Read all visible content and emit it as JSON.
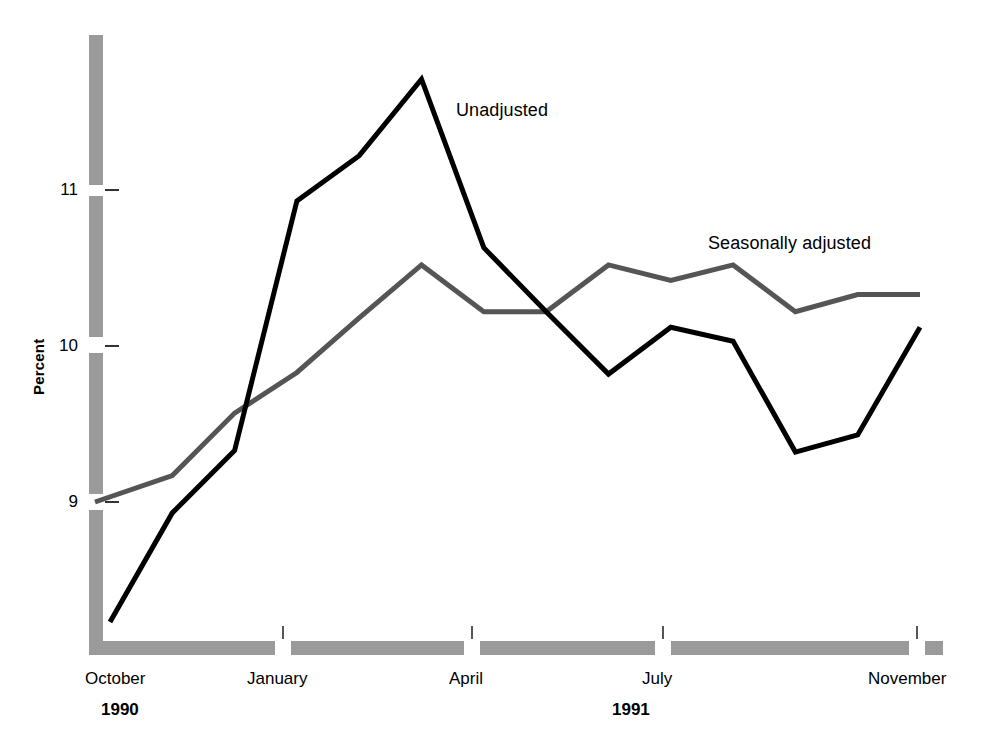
{
  "chart_data": {
    "type": "line",
    "title": "",
    "subtitle": "",
    "xlabel": "",
    "ylabel": "Percent",
    "ylim": [
      8.0,
      11.9
    ],
    "yticks": [
      9,
      10,
      11
    ],
    "ytick_labels": [
      "9",
      "10",
      "11"
    ],
    "grid": false,
    "legend_position": "inline-annotation",
    "x": [
      "October 1990",
      "November 1990",
      "December 1990",
      "January 1991",
      "February 1991",
      "March 1991",
      "April 1991",
      "May 1991",
      "June 1991",
      "July 1991",
      "August 1991",
      "September 1991",
      "October 1991",
      "November 1991"
    ],
    "xtick_labels": [
      "October",
      "January",
      "April",
      "July",
      "November"
    ],
    "xtick_x_index": [
      0,
      3,
      6,
      9,
      13
    ],
    "year_labels": [
      "1990",
      "1991"
    ],
    "series": [
      {
        "name": "Unadjusted",
        "color": "#000000",
        "values": [
          8.23,
          8.93,
          9.33,
          10.93,
          11.22,
          11.71,
          10.63,
          10.22,
          9.82,
          10.12,
          10.03,
          9.32,
          9.43,
          10.12
        ]
      },
      {
        "name": "Seasonally adjusted",
        "color": "#555555",
        "values": [
          9.0,
          9.17,
          9.57,
          9.83,
          10.18,
          10.52,
          10.22,
          10.22,
          10.52,
          10.42,
          10.52,
          10.22,
          10.33,
          10.33
        ]
      }
    ],
    "annotations": [
      {
        "text": "Unadjusted",
        "series": "Unadjusted"
      },
      {
        "text": "Seasonally adjusted",
        "series": "Seasonally adjusted"
      }
    ]
  },
  "axis": {
    "y_title": "Percent",
    "y_tick_0": "9",
    "y_tick_1": "10",
    "y_tick_2": "11",
    "x_tick_0": "October",
    "x_tick_1": "January",
    "x_tick_2": "April",
    "x_tick_3": "July",
    "x_tick_4": "November",
    "year_left": "1990",
    "year_right": "1991",
    "axis_bar_color": "#9a9a9a"
  },
  "labels": {
    "unadjusted": "Unadjusted",
    "seasonally_adjusted": "Seasonally adjusted"
  }
}
